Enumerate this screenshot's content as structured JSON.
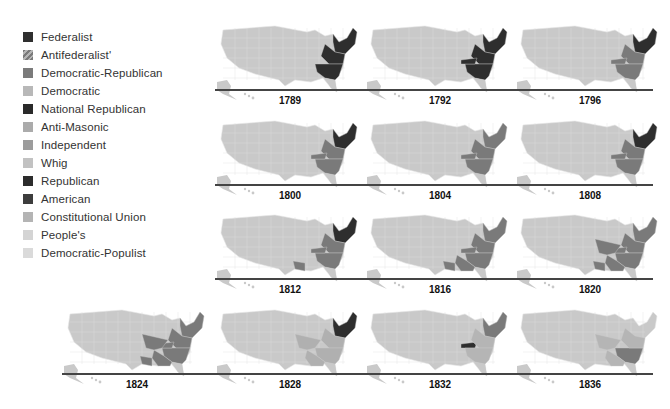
{
  "legend": {
    "items": [
      {
        "label": "Federalist",
        "color": "#2f2f2f",
        "pattern": "solid"
      },
      {
        "label": "Antifederalist'",
        "color": "#8a8a8a",
        "pattern": "hatch"
      },
      {
        "label": "Democratic-Republican",
        "color": "#7b7b7b",
        "pattern": "solid"
      },
      {
        "label": "Democratic",
        "color": "#b8b8b8",
        "pattern": "solid"
      },
      {
        "label": "National Republican",
        "color": "#2a2a2a",
        "pattern": "solid"
      },
      {
        "label": "Anti-Masonic",
        "color": "#ababab",
        "pattern": "solid"
      },
      {
        "label": "Independent",
        "color": "#9c9c9c",
        "pattern": "solid"
      },
      {
        "label": "Whig",
        "color": "#c2c2c2",
        "pattern": "solid"
      },
      {
        "label": "Republican",
        "color": "#2c2c2c",
        "pattern": "solid"
      },
      {
        "label": "American",
        "color": "#3d3d3d",
        "pattern": "solid"
      },
      {
        "label": "Constitutional Union",
        "color": "#b4b4b4",
        "pattern": "solid"
      },
      {
        "label": "People's",
        "color": "#d4d4d4",
        "pattern": "solid"
      },
      {
        "label": "Democratic-Populist",
        "color": "#dadada",
        "pattern": "solid"
      }
    ]
  },
  "colors": {
    "base_map": "#c9c9c9",
    "dark": "#2e2e2e",
    "mid": "#7a7a7a",
    "line": "#444444"
  },
  "maps": [
    {
      "year": "1789",
      "fill": "early_dark"
    },
    {
      "year": "1792",
      "fill": "east_dark"
    },
    {
      "year": "1796",
      "fill": "ne_dark_se_mid"
    },
    {
      "year": "1800",
      "fill": "ne_dark_se_mid"
    },
    {
      "year": "1804",
      "fill": "east_mid"
    },
    {
      "year": "1808",
      "fill": "east_mid_ne_dark"
    },
    {
      "year": "1812",
      "fill": "east_mid_ne_dark_la"
    },
    {
      "year": "1816",
      "fill": "east_mid_la"
    },
    {
      "year": "1820",
      "fill": "full_mid"
    },
    {
      "year": "1824",
      "fill": "full_mid"
    },
    {
      "year": "1828",
      "fill": "ne_dark"
    },
    {
      "year": "1832",
      "fill": "ky_dark"
    },
    {
      "year": "1836",
      "fill": "light_mid"
    }
  ]
}
